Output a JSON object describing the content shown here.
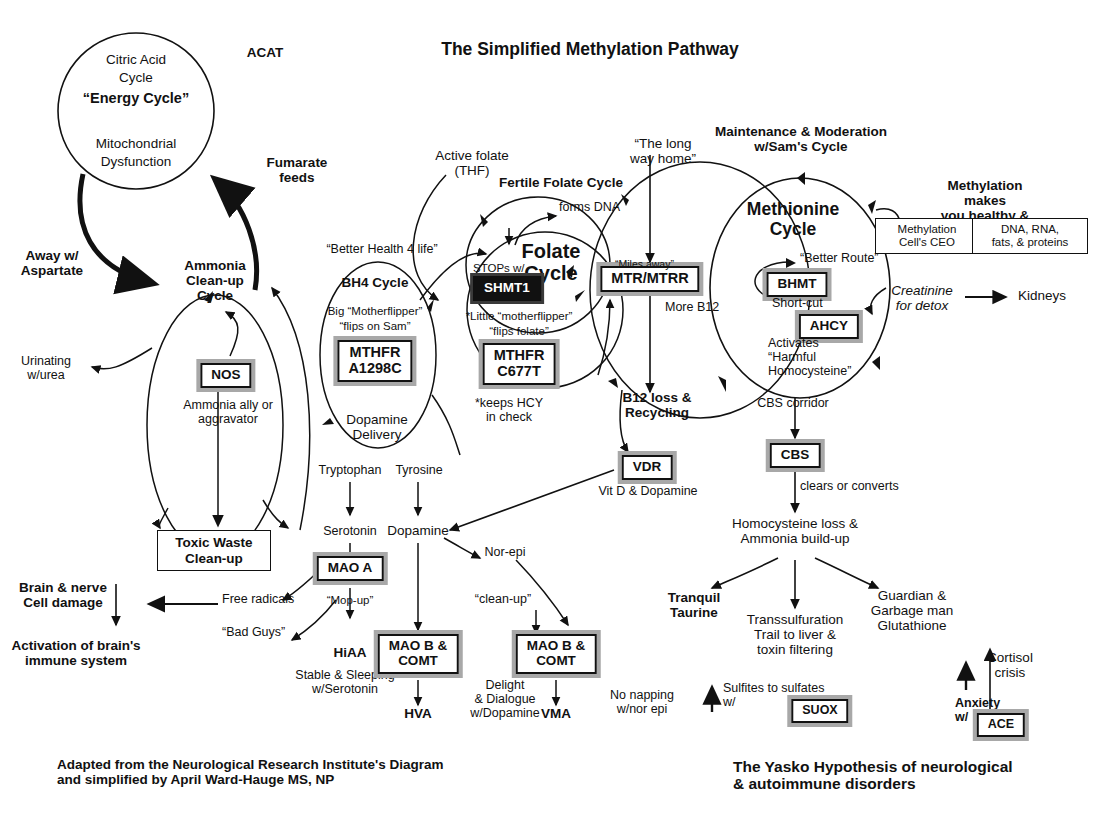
{
  "meta": {
    "title": "The Simplified Methylation Pathway",
    "top_label_acat": "ACAT",
    "footer_left": "Adapted from the Neurological Research Institute's Diagram\nand simplified by April Ward-Hauge MS, NP",
    "footer_right": "The Yasko Hypothesis of neurological\n& autoimmune disorders",
    "ink": "#111111",
    "paper": "#ffffff",
    "box_shadow_grey": "#8a8a8a"
  },
  "cycles": {
    "energy": {
      "line1": "Citric Acid",
      "line2": "Cycle",
      "line3": "“Energy Cycle”",
      "line4": "Mitochondrial",
      "line5": "Dysfunction"
    },
    "bh4": {
      "caption_above": "“Better Health 4 life”",
      "title": "BH4 Cycle",
      "note1": "Big “Motherflipper”",
      "note2": "“flips on Sam”",
      "note_bottom": "Dopamine\nDelivery"
    },
    "fertile_folate": {
      "title": "Fertile Folate Cycle",
      "forms_dna": "forms DNA",
      "active_folate": "Active folate\n(THF)"
    },
    "folate": {
      "title": "Folate\nCycle",
      "stops_with": "STOPs w/",
      "little_note1": "*Little “motherflipper”",
      "little_note2": "“flips folate”",
      "keeps_hcy": "*keeps HCY\nin check"
    },
    "long_way": {
      "label": "“The long\nway home”",
      "more_b12": "More B12",
      "b12_loss": "B12 loss &\nRecycling"
    },
    "methionine": {
      "heading": "Maintenance & Moderation\nw/Sam's Cycle",
      "title": "Methionine\nCycle",
      "better_route": "“Better Route”",
      "short_cut": "Short-cut",
      "activates": "Activates\n“Harmful\nHomocysteine”",
      "cbs_corridor": "CBS corridor"
    }
  },
  "genes": [
    {
      "id": "nos",
      "label": "NOS",
      "style": "grey"
    },
    {
      "id": "mthfr_a1298c",
      "label": "MTHFR\nA1298C",
      "style": "grey"
    },
    {
      "id": "shmt1",
      "label": "SHMT1",
      "style": "dark"
    },
    {
      "id": "mthfr_c677t",
      "label": "MTHFR\nC677T",
      "style": "grey"
    },
    {
      "id": "mtr_mtrr",
      "label": "MTR/MTRR",
      "style": "grey"
    },
    {
      "id": "bhmt",
      "label": "BHMT",
      "style": "grey"
    },
    {
      "id": "ahcy",
      "label": "AHCY",
      "style": "grey"
    },
    {
      "id": "vdr",
      "label": "VDR",
      "style": "grey"
    },
    {
      "id": "cbs",
      "label": "CBS",
      "style": "grey"
    },
    {
      "id": "mao_a",
      "label": "MAO A",
      "style": "grey"
    },
    {
      "id": "mao_b_comt_1",
      "label": "MAO B &\nCOMT",
      "style": "grey"
    },
    {
      "id": "mao_b_comt_2",
      "label": "MAO B &\nCOMT",
      "style": "grey"
    },
    {
      "id": "suox",
      "label": "SUOX",
      "style": "grey"
    },
    {
      "id": "ace",
      "label": "ACE",
      "style": "grey"
    }
  ],
  "boxes": {
    "toxic_waste": "Toxic Waste\nClean-up",
    "methylation_ceo": "Methylation\nCell's CEO",
    "dna_rna": "DNA, RNA,\nfats, & proteins"
  },
  "labels": {
    "fumarate_feeds": "Fumarate\nfeeds",
    "away_aspartate": "Away w/\nAspartate",
    "ammonia_cleanup": "Ammonia\nClean-up\nCycle",
    "urinating_urea": "Urinating\nw/urea",
    "ammonia_ally": "Ammonia ally or\naggravator",
    "brain_nerve": "Brain & nerve\nCell damage",
    "activation_immune": "Activation of brain's\nimmune system",
    "free_radicals": "Free radicals",
    "bad_guys": "“Bad Guys”",
    "tryptophan": "Tryptophan",
    "tyrosine": "Tyrosine",
    "serotonin": "Serotonin",
    "dopamine": "Dopamine",
    "nor_epi": "Nor-epi",
    "mop_up": "“Mop-up”",
    "clean_up": "“clean-up”",
    "hiaa": "HiAA",
    "hva": "HVA",
    "vma": "VMA",
    "stable_sleeping": "Stable & Sleeping\nw/Serotonin",
    "delight_dialogue": "Delight\n& Dialogue\nw/Dopamine",
    "no_napping": "No napping\nw/nor epi",
    "vit_d_dopamine": "Vit D & Dopamine",
    "clears_or_converts": "clears or converts",
    "homocysteine_loss": "Homocysteine loss &\nAmmonia build-up",
    "tranquil_taurine": "Tranquil\nTaurine",
    "transsulfuration": "Transsulfuration\nTrail to liver &\ntoxin filtering",
    "guardian_garbage": "Guardian &\nGarbage man\nGlutathione",
    "sulfites_sulfates": "Sulfites to sulfates\nw/",
    "methylation_makes": "Methylation makes\nyou healthy & human",
    "creatinine_detox": "Creatinine\nfor detox",
    "kidneys": "Kidneys",
    "cortisol_crisis": "Cortisol\ncrisis",
    "anxiety_w": "Anxiety\nw/",
    "miles_away": "“Miles away”"
  }
}
